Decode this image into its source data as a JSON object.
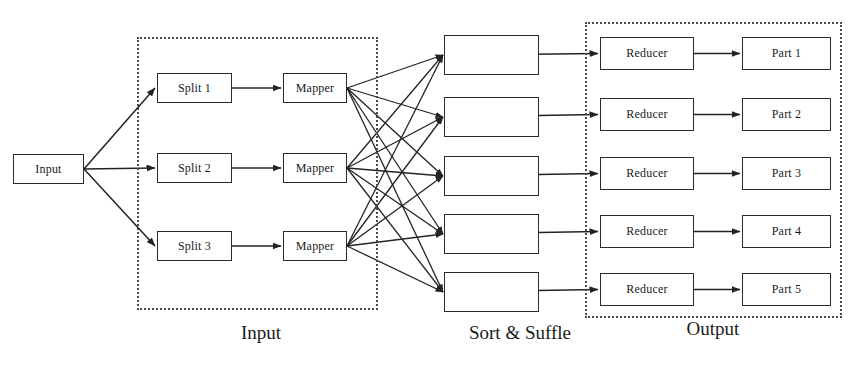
{
  "diagram": {
    "background_color": "#ffffff",
    "line_color": "#232323",
    "frame_color": "#4a4a4a",
    "box_border_color": "#2b2b2b"
  },
  "source": {
    "input_node": {
      "label": "Input",
      "x": 13,
      "y": 154,
      "w": 71,
      "h": 30
    }
  },
  "groups": [
    {
      "id": "input-group",
      "caption": "Input",
      "frame": {
        "x": 137,
        "y": 37,
        "w": 241,
        "h": 273
      },
      "caption_x": 196,
      "caption_y": 322,
      "caption_w": 130
    },
    {
      "id": "shuffle-group",
      "caption": "Sort & Suffle",
      "frame": null,
      "caption_x": 430,
      "caption_y": 322,
      "caption_w": 180
    },
    {
      "id": "output-group",
      "caption": "Output",
      "frame": {
        "x": 585,
        "y": 22,
        "w": 257,
        "h": 296
      },
      "caption_x": 648,
      "caption_y": 318,
      "caption_w": 130
    }
  ],
  "splits": [
    {
      "label": "Split 1",
      "x": 157,
      "y": 73,
      "w": 75,
      "h": 30
    },
    {
      "label": "Split 2",
      "x": 157,
      "y": 153,
      "w": 75,
      "h": 30
    },
    {
      "label": "Split 3",
      "x": 157,
      "y": 231,
      "w": 75,
      "h": 30
    }
  ],
  "mappers": [
    {
      "label": "Mapper",
      "x": 283,
      "y": 73,
      "w": 64,
      "h": 30
    },
    {
      "label": "Mapper",
      "x": 283,
      "y": 153,
      "w": 64,
      "h": 30
    },
    {
      "label": "Mapper",
      "x": 283,
      "y": 231,
      "w": 64,
      "h": 30
    }
  ],
  "shuffle_boxes": [
    {
      "label": "",
      "x": 444,
      "y": 35,
      "w": 95,
      "h": 40
    },
    {
      "label": "",
      "x": 444,
      "y": 97,
      "w": 95,
      "h": 40
    },
    {
      "label": "",
      "x": 444,
      "y": 156,
      "w": 95,
      "h": 40
    },
    {
      "label": "",
      "x": 444,
      "y": 214,
      "w": 95,
      "h": 40
    },
    {
      "label": "",
      "x": 444,
      "y": 272,
      "w": 95,
      "h": 40
    }
  ],
  "reducers": [
    {
      "label": "Reducer",
      "x": 600,
      "y": 37,
      "w": 94,
      "h": 33
    },
    {
      "label": "Reducer",
      "x": 600,
      "y": 98,
      "w": 94,
      "h": 33
    },
    {
      "label": "Reducer",
      "x": 600,
      "y": 157,
      "w": 94,
      "h": 33
    },
    {
      "label": "Reducer",
      "x": 600,
      "y": 215,
      "w": 94,
      "h": 33
    },
    {
      "label": "Reducer",
      "x": 600,
      "y": 273,
      "w": 94,
      "h": 33
    }
  ],
  "parts": [
    {
      "label": "Part 1",
      "x": 742,
      "y": 37,
      "w": 89,
      "h": 33
    },
    {
      "label": "Part 2",
      "x": 742,
      "y": 98,
      "w": 89,
      "h": 33
    },
    {
      "label": "Part 3",
      "x": 742,
      "y": 157,
      "w": 89,
      "h": 33
    },
    {
      "label": "Part 4",
      "x": 742,
      "y": 215,
      "w": 89,
      "h": 33
    },
    {
      "label": "Part 5",
      "x": 742,
      "y": 273,
      "w": 89,
      "h": 33
    }
  ],
  "typography": {
    "node_font_size": "12px",
    "caption_font_size": "19px"
  }
}
